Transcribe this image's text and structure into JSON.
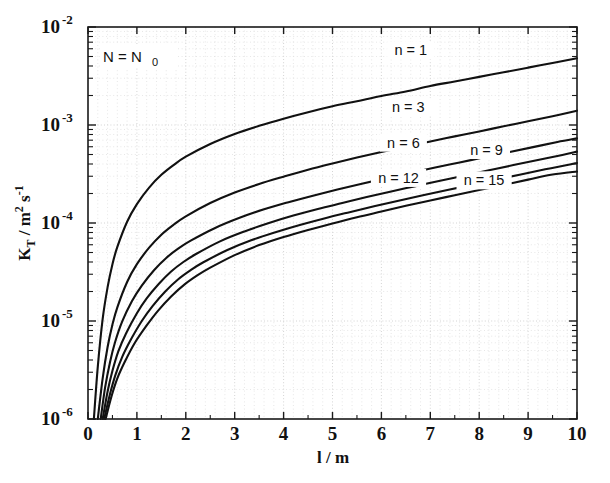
{
  "chart_data": {
    "type": "line",
    "title": "",
    "xlabel": "l / m",
    "ylabel": "K_T / m^2 s^-1",
    "ylabel_parts": {
      "main": "K",
      "sub": "T",
      "mid": " / m",
      "sup1": "2",
      "unit": " s",
      "sup2": "-1"
    },
    "xlabel_parts": {
      "main": "l / m"
    },
    "annotation": {
      "text": "N = N",
      "subscript": "0",
      "full": "N = N0"
    },
    "xscale": "linear",
    "yscale": "log",
    "xlim": [
      0,
      10
    ],
    "ylim": [
      1e-06,
      0.01
    ],
    "grid": true,
    "grid_style": "dotted",
    "legend_position": "inline-curve-labels",
    "x_ticks": [
      "0",
      "1",
      "2",
      "3",
      "4",
      "5",
      "6",
      "7",
      "8",
      "9",
      "10"
    ],
    "x_tick_values": [
      0,
      1,
      2,
      3,
      4,
      5,
      6,
      7,
      8,
      9,
      10
    ],
    "y_ticks": [
      "10-2",
      "10-3",
      "10-4",
      "10-5",
      "10-6"
    ],
    "y_tick_mantissa": [
      "10",
      "10",
      "10",
      "10",
      "10"
    ],
    "y_tick_exponents": [
      "-2",
      "-3",
      "-4",
      "-5",
      "-6"
    ],
    "y_tick_values": [
      0.01,
      0.001,
      0.0001,
      1e-05,
      1e-06
    ],
    "series": [
      {
        "name": "n = 1",
        "label": "n = 1",
        "n": 1,
        "label_x": 6.6,
        "label_y": 0.0055,
        "x": [
          0.12,
          0.2,
          0.3,
          0.4,
          0.5,
          0.6,
          0.8,
          1.0,
          1.25,
          1.5,
          1.75,
          2.0,
          2.5,
          3.0,
          3.5,
          4.0,
          4.5,
          5.0,
          5.5,
          6.0,
          6.5,
          7.0,
          7.5,
          8.0,
          8.5,
          9.0,
          9.5,
          10.0
        ],
        "y": [
          1e-06,
          3.4e-06,
          1.05e-05,
          2.2e-05,
          3.8e-05,
          5.7e-05,
          0.000103,
          0.000156,
          0.00023,
          0.00031,
          0.00039,
          0.000475,
          0.00064,
          0.00081,
          0.00098,
          0.00116,
          0.00135,
          0.00155,
          0.00175,
          0.00198,
          0.0022,
          0.0025,
          0.00278,
          0.0031,
          0.00345,
          0.00385,
          0.0043,
          0.0048
        ]
      },
      {
        "name": "n = 3",
        "label": "n = 3",
        "n": 3,
        "label_x": 6.55,
        "label_y": 0.00145,
        "x": [
          0.2,
          0.3,
          0.4,
          0.5,
          0.6,
          0.8,
          1.0,
          1.25,
          1.5,
          1.75,
          2.0,
          2.5,
          3.0,
          3.5,
          4.0,
          4.5,
          5.0,
          5.5,
          6.0,
          6.5,
          7.0,
          7.5,
          8.0,
          8.5,
          9.0,
          9.5,
          10.0
        ],
        "y": [
          1e-06,
          2.6e-06,
          5.4e-06,
          9.2e-06,
          1.38e-05,
          2.5e-05,
          3.8e-05,
          5.6e-05,
          7.6e-05,
          9.6e-05,
          0.000117,
          0.00016,
          0.000205,
          0.00025,
          0.000297,
          0.00035,
          0.000405,
          0.000465,
          0.00053,
          0.0006,
          0.00068,
          0.000765,
          0.00086,
          0.00097,
          0.00109,
          0.00123,
          0.0014
        ]
      },
      {
        "name": "n = 6",
        "label": "n = 6",
        "n": 6,
        "label_x": 6.45,
        "label_y": 0.00063,
        "x": [
          0.26,
          0.35,
          0.45,
          0.55,
          0.7,
          0.9,
          1.1,
          1.35,
          1.6,
          1.85,
          2.1,
          2.6,
          3.1,
          3.6,
          4.1,
          4.6,
          5.1,
          5.6,
          6.1,
          6.6,
          7.1,
          7.6,
          8.1,
          8.6,
          9.1,
          9.6,
          10.0
        ],
        "y": [
          1e-06,
          2.1e-06,
          3.8e-06,
          6e-06,
          9.9e-06,
          1.6e-05,
          2.3e-05,
          3.3e-05,
          4.4e-05,
          5.5e-05,
          6.6e-05,
          8.9e-05,
          0.000113,
          0.000138,
          0.000163,
          0.00019,
          0.00022,
          0.000252,
          0.000287,
          0.000325,
          0.000368,
          0.000415,
          0.000468,
          0.000528,
          0.000595,
          0.00067,
          0.00073
        ]
      },
      {
        "name": "n = 9",
        "label": "n = 9",
        "n": 9,
        "label_x": 8.15,
        "label_y": 0.00053,
        "x": [
          0.3,
          0.4,
          0.5,
          0.62,
          0.78,
          1.0,
          1.2,
          1.45,
          1.7,
          1.95,
          2.2,
          2.7,
          3.2,
          3.7,
          4.2,
          4.7,
          5.2,
          5.7,
          6.2,
          6.7,
          7.2,
          7.7,
          8.2,
          8.7,
          9.2,
          9.7,
          10.0
        ],
        "y": [
          1e-06,
          1.9e-06,
          3.1e-06,
          4.9e-06,
          7.5e-06,
          1.2e-05,
          1.7e-05,
          2.4e-05,
          3.2e-05,
          4e-05,
          4.8e-05,
          6.5e-05,
          8.2e-05,
          0.0001,
          0.000119,
          0.000139,
          0.00016,
          0.000184,
          0.00021,
          0.000238,
          0.00027,
          0.000305,
          0.000345,
          0.00039,
          0.00044,
          0.000495,
          0.000535
        ]
      },
      {
        "name": "n = 12",
        "label": "n = 12",
        "n": 12,
        "label_x": 6.35,
        "label_y": 0.000275,
        "x": [
          0.33,
          0.45,
          0.56,
          0.7,
          0.88,
          1.1,
          1.32,
          1.58,
          1.84,
          2.1,
          2.35,
          2.85,
          3.35,
          3.85,
          4.35,
          4.85,
          5.35,
          5.85,
          6.35,
          6.85,
          7.35,
          7.85,
          8.35,
          8.85,
          9.35,
          9.8,
          10.0
        ],
        "y": [
          1e-06,
          1.8e-06,
          2.8e-06,
          4.3e-06,
          6.5e-06,
          1e-05,
          1.42e-05,
          2e-05,
          2.65e-05,
          3.3e-05,
          3.95e-05,
          5.3e-05,
          6.7e-05,
          8.1e-05,
          9.6e-05,
          0.000112,
          0.000129,
          0.000148,
          0.000169,
          0.000192,
          0.000217,
          0.000245,
          0.000277,
          0.000313,
          0.000353,
          0.00039,
          0.00041
        ]
      },
      {
        "name": "n = 15",
        "label": "n = 15",
        "n": 15,
        "label_x": 8.1,
        "label_y": 0.00026,
        "x": [
          0.36,
          0.48,
          0.6,
          0.76,
          0.95,
          1.2,
          1.43,
          1.7,
          1.97,
          2.25,
          2.5,
          3.0,
          3.5,
          4.0,
          4.5,
          5.0,
          5.5,
          6.0,
          6.5,
          7.0,
          7.5,
          8.0,
          8.5,
          9.0,
          9.5,
          10.0
        ],
        "y": [
          1e-06,
          1.7e-06,
          2.6e-06,
          3.9e-06,
          5.9e-06,
          9e-06,
          1.27e-05,
          1.78e-05,
          2.35e-05,
          2.95e-05,
          3.5e-05,
          4.7e-05,
          5.95e-05,
          7.2e-05,
          8.5e-05,
          9.9e-05,
          0.0001145,
          0.000131,
          0.00015,
          0.00017,
          0.000192,
          0.000217,
          0.000245,
          0.000277,
          0.000312,
          0.000335
        ]
      }
    ]
  }
}
